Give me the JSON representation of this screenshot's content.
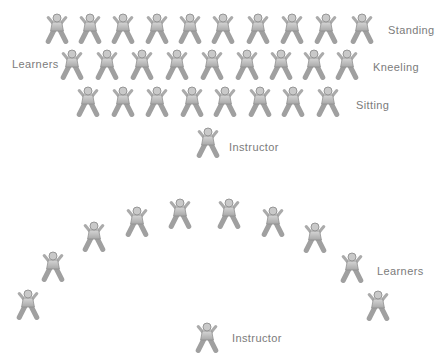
{
  "figure_colors": {
    "limb": "#a0a0a0",
    "arm": "#ababab",
    "torso_top": "#d6d6d6",
    "torso_bottom": "#a8a8a8",
    "outline": "#8f8f8f",
    "head": "#c9c9c9",
    "label_text": "#7b7b7b"
  },
  "top_diagram": {
    "learners_label": "Learners",
    "rows": [
      {
        "label": "Standing",
        "y": 29,
        "xs": [
          57,
          90,
          123,
          157,
          190,
          223,
          258,
          292,
          326,
          362
        ]
      },
      {
        "label": "Kneeling",
        "y": 65,
        "xs": [
          72,
          107,
          142,
          177,
          212,
          247,
          281,
          314,
          347
        ]
      },
      {
        "label": "Sitting",
        "y": 102,
        "xs": [
          88,
          123,
          157,
          192,
          225,
          260,
          293,
          328
        ]
      }
    ],
    "instructor": {
      "label": "Instructor",
      "x": 208,
      "y": 143
    }
  },
  "bottom_diagram": {
    "learners_label": "Learners",
    "positions": [
      [
        28,
        305
      ],
      [
        53,
        267
      ],
      [
        94,
        237
      ],
      [
        137,
        222
      ],
      [
        180,
        214
      ],
      [
        229,
        214
      ],
      [
        273,
        222
      ],
      [
        315,
        238
      ],
      [
        352,
        268
      ],
      [
        378,
        306
      ]
    ],
    "instructor": {
      "label": "Instructor",
      "x": 207,
      "y": 338
    }
  }
}
